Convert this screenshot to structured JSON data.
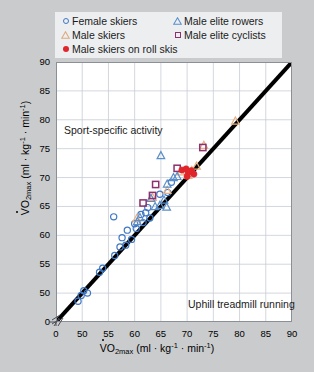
{
  "legend": {
    "items": [
      {
        "label": "Female skiers",
        "marker": "circle-open-blue",
        "color": "#3f78c4"
      },
      {
        "label": "Male elite rowers",
        "marker": "triangle-open-blue",
        "color": "#3f78c4"
      },
      {
        "label": "Male skiers",
        "marker": "triangle-open-orange",
        "color": "#e8b184"
      },
      {
        "label": "Male elite cyclists",
        "marker": "square-open-purple",
        "color": "#8e2f6e"
      },
      {
        "label": "Male skiers on roll skis",
        "marker": "circle-filled-red",
        "color": "#e0262b"
      }
    ]
  },
  "annotations": {
    "sport_specific": "Sport-specific activity",
    "uphill": "Uphill treadmill running"
  },
  "axis_labels": {
    "x_prefix": "VO",
    "x_sub": "2max",
    "x_units_open": " (ml · kg",
    "x_sup1": "-1",
    "x_mid": " · min",
    "x_sup2": "-1",
    "x_close": ")",
    "y_prefix": "VO",
    "y_sub": "2max",
    "y_units_open": " (ml · kg",
    "y_sup1": "-1",
    "y_mid": " · min",
    "y_sup2": "-1",
    "y_close": ")"
  },
  "chart_data": {
    "type": "scatter",
    "title": "",
    "xlabel": "VO2max (ml · kg^-1 · min^-1)",
    "ylabel": "VO2max (ml · kg^-1 · min^-1)",
    "xlim": [
      45,
      90
    ],
    "ylim": [
      45,
      90
    ],
    "x_ticks": [
      0,
      50,
      55,
      60,
      65,
      70,
      75,
      80,
      85,
      90
    ],
    "y_ticks": [
      0,
      50,
      55,
      60,
      65,
      70,
      75,
      80,
      85,
      90
    ],
    "axis_break": true,
    "grid": true,
    "legend_position": "above-plot",
    "identity_line": {
      "from": [
        45,
        45
      ],
      "to": [
        90,
        90
      ],
      "label": "line of identity",
      "color": "#000000",
      "width": 4
    },
    "series": [
      {
        "name": "Female skiers",
        "marker": "circle-open",
        "color": "#3f78c4",
        "points": [
          [
            49.2,
            48.6
          ],
          [
            49.8,
            49.6
          ],
          [
            50.3,
            50.4
          ],
          [
            51.0,
            50.0
          ],
          [
            53.3,
            53.6
          ],
          [
            53.9,
            54.3
          ],
          [
            56.2,
            56.5
          ],
          [
            57.2,
            58.0
          ],
          [
            57.6,
            59.6
          ],
          [
            58.3,
            58.3
          ],
          [
            58.6,
            60.9
          ],
          [
            59.4,
            59.3
          ],
          [
            60.0,
            62.0
          ],
          [
            60.3,
            61.2
          ],
          [
            56.0,
            63.2
          ],
          [
            61.2,
            63.6
          ],
          [
            61.6,
            62.2
          ],
          [
            62.1,
            63.9
          ],
          [
            62.5,
            64.8
          ],
          [
            62.9,
            63.0
          ],
          [
            64.8,
            67.1
          ],
          [
            66.3,
            67.4
          ],
          [
            67.0,
            69.2
          ]
        ]
      },
      {
        "name": "Male skiers",
        "marker": "triangle-open",
        "color": "#e8b184",
        "points": [
          [
            60.4,
            62.9
          ],
          [
            63.4,
            66.6
          ],
          [
            66.2,
            67.8
          ],
          [
            68.8,
            71.0
          ],
          [
            70.2,
            70.4
          ],
          [
            70.9,
            71.2
          ],
          [
            71.8,
            72.0
          ],
          [
            73.2,
            75.6
          ],
          [
            79.2,
            79.8
          ]
        ]
      },
      {
        "name": "Male elite rowers",
        "marker": "triangle-open",
        "color": "#5b8fc9",
        "points": [
          [
            60.5,
            62.4
          ],
          [
            61.0,
            63.1
          ],
          [
            63.1,
            66.4
          ],
          [
            63.9,
            65.0
          ],
          [
            64.8,
            65.2
          ],
          [
            65.6,
            66.1
          ],
          [
            66.1,
            64.9
          ],
          [
            66.2,
            68.9
          ],
          [
            65.0,
            73.8
          ],
          [
            67.4,
            70.0
          ],
          [
            68.1,
            70.2
          ]
        ]
      },
      {
        "name": "Male elite cyclists",
        "marker": "square-open",
        "color": "#8e2f6e",
        "points": [
          [
            61.6,
            65.6
          ],
          [
            63.4,
            66.9
          ],
          [
            64.0,
            68.8
          ],
          [
            68.1,
            71.6
          ],
          [
            73.0,
            75.2
          ]
        ]
      },
      {
        "name": "Male skiers on roll skis",
        "marker": "circle-filled",
        "color": "#e0262b",
        "points": [
          [
            69.0,
            71.3
          ],
          [
            69.8,
            71.5
          ],
          [
            70.2,
            70.9
          ],
          [
            70.8,
            71.2
          ],
          [
            71.3,
            70.6
          ],
          [
            70.0,
            70.2
          ]
        ]
      }
    ]
  }
}
